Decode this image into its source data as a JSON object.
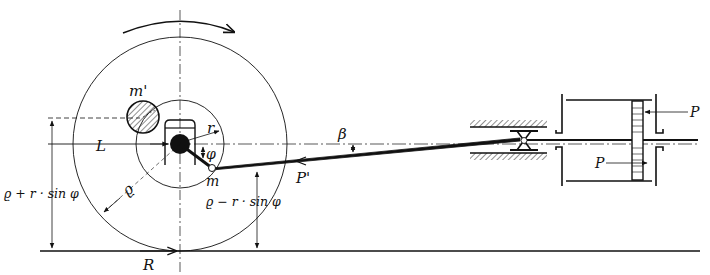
{
  "diagram": {
    "type": "mechanism",
    "colors": {
      "ink": "#111111",
      "background": "#ffffff"
    },
    "labels": {
      "counterweight": "m'",
      "crank_radius": "r",
      "axle_force": "L",
      "crank_angle": "φ",
      "crank_pin_mass": "m",
      "wheel_radius": "ϱ",
      "upper_height": "ϱ + r · sin φ",
      "lower_height": "ϱ − r · sin φ",
      "rod_force": "P'",
      "rod_angle": "β",
      "rail_reaction": "R",
      "piston_pressure_top": "P",
      "piston_pressure_bottom": "P"
    },
    "rotation": "clockwise"
  }
}
